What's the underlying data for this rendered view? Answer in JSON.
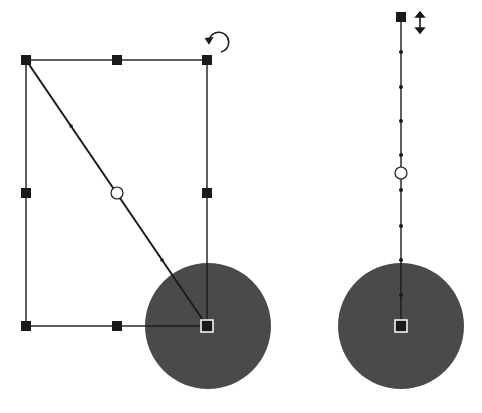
{
  "canvas": {
    "width": 482,
    "height": 413,
    "background": "#ffffff"
  },
  "colors": {
    "line": "#1a1a1a",
    "handle": "#1a1a1a",
    "disc": "#4a4a4a",
    "handle_outline": "#ffffff"
  },
  "left_figure": {
    "label": "rotate-transform-selection",
    "bbox": {
      "x1": 26,
      "y1": 60,
      "x2": 207,
      "y2": 326
    },
    "handles": [
      {
        "x": 26,
        "y": 60
      },
      {
        "x": 117,
        "y": 60
      },
      {
        "x": 207,
        "y": 60
      },
      {
        "x": 26,
        "y": 193
      },
      {
        "x": 207,
        "y": 193
      },
      {
        "x": 26,
        "y": 326
      },
      {
        "x": 117,
        "y": 326
      }
    ],
    "diagonal": {
      "x1": 26,
      "y1": 60,
      "x2": 207,
      "y2": 326
    },
    "center_circle": {
      "x": 117,
      "y": 193,
      "r": 6
    },
    "disc": {
      "cx": 208,
      "cy": 326,
      "r": 63
    },
    "pivot_handle": {
      "x": 207,
      "y": 326
    },
    "rotate_icon": {
      "x": 218,
      "y": 42
    },
    "midpoint_dots": [
      {
        "x": 71,
        "y": 126
      },
      {
        "x": 162,
        "y": 260
      }
    ]
  },
  "right_figure": {
    "label": "scale-vertical-selection",
    "line": {
      "x": 401,
      "y1": 17,
      "y2": 326
    },
    "top_handle": {
      "x": 401,
      "y": 17
    },
    "center_circle": {
      "x": 401,
      "y": 173,
      "r": 6
    },
    "dots": [
      52,
      87,
      121,
      155,
      190,
      226,
      260,
      295
    ],
    "disc": {
      "cx": 401,
      "cy": 326,
      "r": 63
    },
    "pivot_handle": {
      "x": 401,
      "y": 326
    },
    "resize_icon": {
      "x": 420,
      "y": 22
    }
  }
}
